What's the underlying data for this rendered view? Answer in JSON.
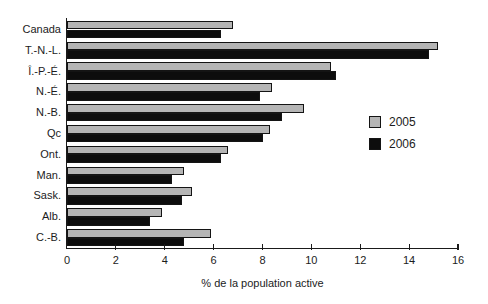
{
  "figure": {
    "background": "#ffffff",
    "axis_color": "#1a1a1a"
  },
  "chart_data": {
    "type": "bar",
    "orientation": "horizontal",
    "title": "",
    "xlabel": "% de la population active",
    "ylabel": "",
    "xlim": [
      0,
      16
    ],
    "xticks": [
      0,
      2,
      4,
      6,
      8,
      10,
      12,
      14,
      16
    ],
    "grid": false,
    "categories": [
      "Canada",
      "T.-N.-L.",
      "Î.-P.-É.",
      "N.-É.",
      "N.-B.",
      "Qc",
      "Ont.",
      "Man.",
      "Sask.",
      "Alb.",
      "C.-B."
    ],
    "series": [
      {
        "name": "2005",
        "color": "#b5b5b5",
        "values": [
          6.8,
          15.2,
          10.8,
          8.4,
          9.7,
          8.3,
          6.6,
          4.8,
          5.1,
          3.9,
          5.9
        ]
      },
      {
        "name": "2006",
        "color": "#0d0d0d",
        "values": [
          6.3,
          14.8,
          11.0,
          7.9,
          8.8,
          8.0,
          6.3,
          4.3,
          4.7,
          3.4,
          4.8
        ]
      }
    ],
    "legend": {
      "position": "center-right",
      "entries": [
        "2005",
        "2006"
      ]
    }
  }
}
